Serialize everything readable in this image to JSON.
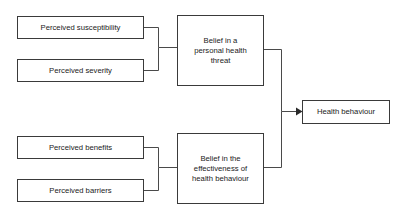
{
  "diagram": {
    "background_color": "#ffffff",
    "box_border_color": "#3a3a3a",
    "box_fill_color": "#ffffff",
    "connector_color": "#4a4a4a",
    "text_color": "#1a1a1a",
    "nodes": {
      "perceived_susceptibility": {
        "label": "Perceived susceptibility"
      },
      "perceived_severity": {
        "label": "Perceived severity"
      },
      "belief_threat": {
        "line1": "Belief in a",
        "line2": "personal health",
        "line3": "threat"
      },
      "perceived_benefits": {
        "label": "Perceived benefits"
      },
      "perceived_barriers": {
        "label": "Perceived barriers"
      },
      "belief_effectiveness": {
        "line1": "Belief in the",
        "line2": "effectiveness of",
        "line3": "health behaviour"
      },
      "health_behaviour": {
        "label": "Health behaviour"
      }
    }
  }
}
